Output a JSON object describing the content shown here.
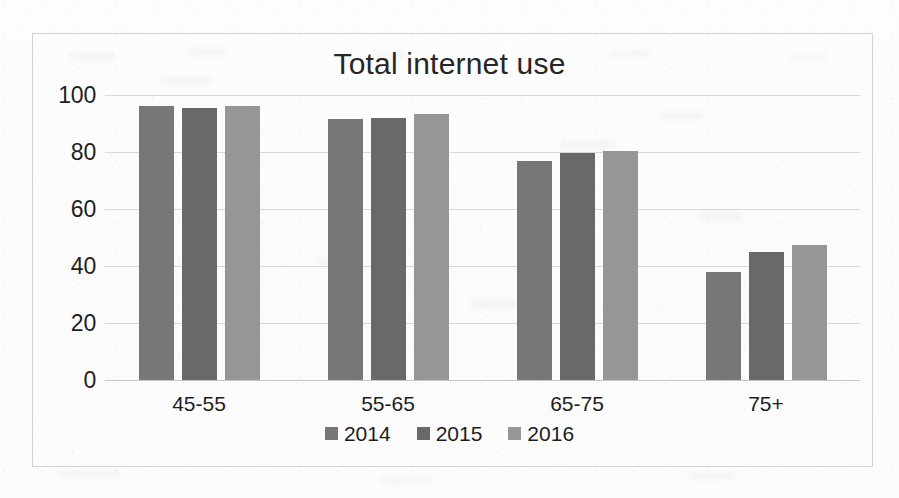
{
  "chart_data": {
    "type": "bar",
    "title": "Total internet use",
    "xlabel": "",
    "ylabel": "",
    "categories": [
      "45-55",
      "55-65",
      "65-75",
      "75+"
    ],
    "series": [
      {
        "name": "2014",
        "color": "#777777",
        "values": [
          96,
          91.5,
          77,
          38
        ]
      },
      {
        "name": "2015",
        "color": "#696969",
        "values": [
          95.5,
          92,
          79.5,
          45
        ]
      },
      {
        "name": "2016",
        "color": "#969696",
        "values": [
          96,
          93.5,
          80.5,
          47.5
        ]
      }
    ],
    "ylim": [
      0,
      100
    ],
    "yticks": [
      "0",
      "20",
      "40",
      "60",
      "80",
      "100"
    ],
    "ytick_values": [
      0,
      20,
      40,
      60,
      80,
      100
    ],
    "grid": true,
    "legend_position": "bottom"
  },
  "frame": {
    "border_color": "#d2d2d2",
    "gridline_color": "#d8d8d8",
    "background": "#fdfdfd"
  }
}
